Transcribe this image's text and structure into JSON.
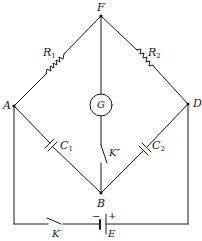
{
  "diagram": {
    "type": "bridge-circuit",
    "colors": {
      "line": "#1a1a1a",
      "background": "#ffffff"
    },
    "nodes": {
      "F": {
        "label": "F"
      },
      "A": {
        "label": "A"
      },
      "D": {
        "label": "D"
      },
      "B": {
        "label": "B"
      }
    },
    "components": {
      "R1": {
        "symbol": "R",
        "sub": "1",
        "kind": "resistor",
        "between": [
          "A",
          "F"
        ]
      },
      "R2": {
        "symbol": "R",
        "sub": "2",
        "kind": "resistor",
        "between": [
          "F",
          "D"
        ]
      },
      "C1": {
        "symbol": "C",
        "sub": "1",
        "kind": "capacitor",
        "between": [
          "A",
          "B"
        ]
      },
      "C2": {
        "symbol": "C",
        "sub": "2",
        "kind": "capacitor",
        "between": [
          "B",
          "D"
        ]
      },
      "G": {
        "label": "G",
        "kind": "galvanometer",
        "between": [
          "F",
          "B"
        ]
      },
      "K2": {
        "label": "K″",
        "kind": "switch",
        "between": [
          "G",
          "B"
        ]
      },
      "K1": {
        "label": "K′",
        "kind": "switch",
        "between": [
          "A",
          "E"
        ]
      },
      "E": {
        "label": "E",
        "kind": "battery",
        "minus": "−",
        "plus": "+",
        "between": [
          "K′",
          "D"
        ]
      }
    }
  }
}
